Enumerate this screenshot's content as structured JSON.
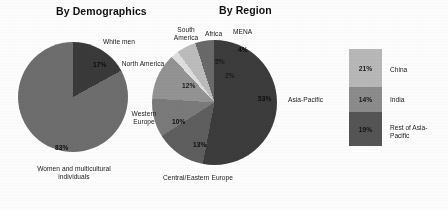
{
  "figure": {
    "background_color": "#ffffff"
  },
  "charts": {
    "demographics": {
      "title": "By Demographics",
      "labels": {
        "white_men": "White men",
        "women": "Women and multicultural individuals"
      },
      "percent_labels": {
        "white_men": "17%",
        "women": "83%"
      }
    },
    "region": {
      "title": "By Region",
      "labels": {
        "south_america": "South America",
        "africa": "Africa",
        "mena": "MENA",
        "north_america": "North America",
        "western_europe": "Western Europe",
        "central_eastern_europe": "Central/Eastern Europe",
        "asia_pacific": "Asia-Pacific"
      },
      "percent_labels": {
        "mena": "4%",
        "africa": "5%",
        "south_america": "2%",
        "north_america": "12%",
        "western_europe": "10%",
        "central_eastern_europe": "13%",
        "asia_pacific": "53%"
      }
    },
    "asia_breakdown": {
      "bands": [
        {
          "label": "China",
          "percent_label": "21%",
          "color": "#b9b9b9"
        },
        {
          "label": "India",
          "percent_label": "14%",
          "color": "#8c8c8c"
        },
        {
          "label": "Rest of Asia-Pacific",
          "percent_label": "19%",
          "color": "#555555"
        }
      ]
    }
  },
  "chart_data": [
    {
      "type": "pie",
      "title": "By Demographics",
      "categories": [
        "White men",
        "Women and multicultural individuals"
      ],
      "values": [
        17,
        83
      ],
      "unit": "percent",
      "data_labels": [
        "17%",
        "83%"
      ],
      "colors": [
        "#3a3a3a",
        "#6e6e6e"
      ],
      "legend": "none",
      "label_position": "outside-with-inline-percent",
      "start_angle_deg": 0,
      "direction": "clockwise"
    },
    {
      "type": "pie",
      "title": "By Region",
      "categories": [
        "Asia-Pacific",
        "Central/Eastern Europe",
        "Western Europe",
        "North America",
        "South America",
        "Africa",
        "MENA"
      ],
      "values": [
        53,
        13,
        10,
        12,
        2,
        5,
        4
      ],
      "unit": "percent",
      "data_labels": [
        "53%",
        "13%",
        "10%",
        "12%",
        "2%",
        "5%",
        "4%"
      ],
      "colors": [
        "#3c3c3c",
        "#5f5f5f",
        "#7b7b7b",
        "#949494",
        "#e0e0e0",
        "#bdbdbd",
        "#6a6a6a"
      ],
      "legend": "none",
      "label_position": "outside-with-inline-percent",
      "start_angle_deg": 0,
      "direction": "clockwise",
      "note": "Values sum to 99 due to rounding"
    },
    {
      "type": "bar",
      "orientation": "vertical-stacked",
      "title": "Asia-Pacific breakdown",
      "categories": [
        "China",
        "India",
        "Rest of Asia-Pacific"
      ],
      "values": [
        21,
        14,
        19
      ],
      "unit": "percent",
      "data_labels": [
        "21%",
        "14%",
        "19%"
      ],
      "colors": [
        "#b9b9b9",
        "#8c8c8c",
        "#555555"
      ],
      "legend": "right",
      "note": "Breakdown of the Asia-Pacific share"
    }
  ]
}
